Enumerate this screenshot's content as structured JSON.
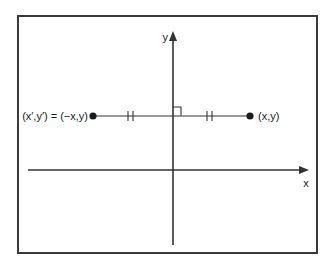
{
  "figure": {
    "y_axis_label": "y",
    "x_axis_label": "x",
    "left_point_label": "(x′,y′) = (−x,y)",
    "right_point_label": "(x,y)"
  },
  "colors": {
    "background": "#ffffff",
    "stroke": "#333333",
    "border": "#3a3a3a",
    "text": "#1c1c1c"
  }
}
